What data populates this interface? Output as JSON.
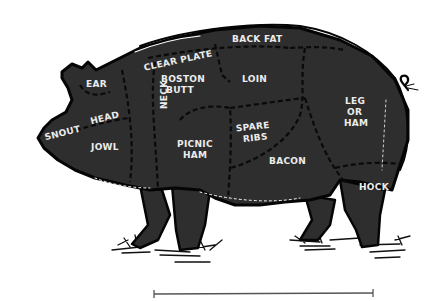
{
  "diagram": {
    "colors": {
      "body": "#2e2e2e",
      "outline": "#050505",
      "label": "#ececec",
      "background": "#ffffff",
      "scale_bar": "#555555"
    },
    "cuts": {
      "ear": "EAR",
      "head": "HEAD",
      "snout": "SNOUT",
      "jowl": "JOWL",
      "neck": "NECK",
      "clear_plate": "CLEAR PLATE",
      "back_fat": "BACK FAT",
      "boston_butt": [
        "BOSTON",
        "BUTT"
      ],
      "loin": "LOIN",
      "picnic_ham": [
        "PICNIC",
        "HAM"
      ],
      "spare_ribs": [
        "SPARE",
        "RIBS"
      ],
      "bacon": "BACON",
      "leg_or_ham": [
        "LEG",
        "OR",
        "HAM"
      ],
      "hock": "HOCK"
    }
  }
}
